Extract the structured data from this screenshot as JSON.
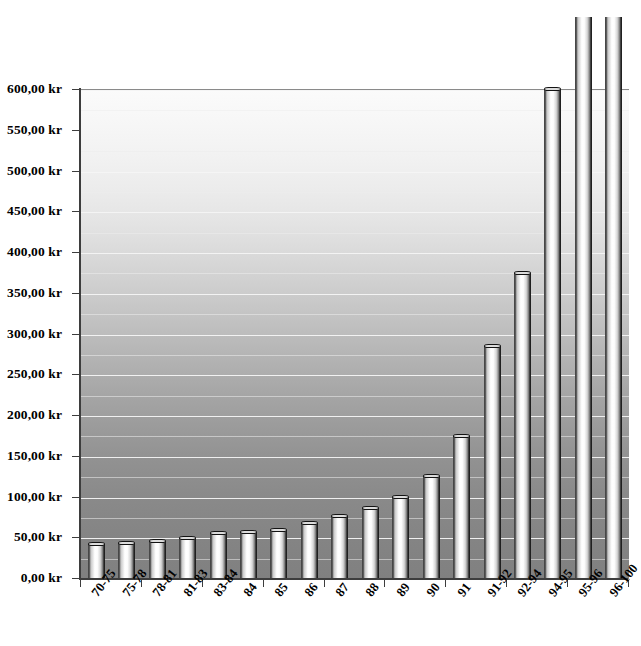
{
  "chart_data": {
    "type": "bar",
    "title": "",
    "subtitle": "",
    "xlabel": "",
    "ylabel": "",
    "currency_suffix": "kr",
    "decimal_separator": ",",
    "ylim": [
      0,
      600
    ],
    "y_tick_step": 50,
    "y_gridline_step": 25,
    "grid": true,
    "legend": false,
    "legend_position": "none",
    "note": "Last two bars exceed the plotted axis maximum and are clipped by the top of the image.",
    "categories": [
      "70-75",
      "75-78",
      "78-81",
      "81-83",
      "83-84",
      "84",
      "85",
      "86",
      "87",
      "88",
      "89",
      "90",
      "91",
      "91-92",
      "92-94",
      "94-95",
      "95-96",
      "96-100"
    ],
    "values": [
      43,
      44,
      47,
      50,
      56,
      58,
      60,
      69,
      77,
      87,
      101,
      127,
      175,
      286,
      375,
      601,
      690,
      690
    ],
    "clipped_flags": [
      false,
      false,
      false,
      false,
      false,
      false,
      false,
      false,
      false,
      false,
      false,
      false,
      false,
      false,
      false,
      false,
      true,
      true
    ],
    "y_tick_labels": [
      "0,00 kr",
      "50,00 kr",
      "100,00 kr",
      "150,00 kr",
      "200,00 kr",
      "250,00 kr",
      "300,00 kr",
      "350,00 kr",
      "400,00 kr",
      "450,00 kr",
      "500,00 kr",
      "550,00 kr",
      "600,00 kr"
    ],
    "y_tick_values": [
      0,
      50,
      100,
      150,
      200,
      250,
      300,
      350,
      400,
      450,
      500,
      550,
      600
    ],
    "colors": {
      "bar_highlight": "#ffffff",
      "bar_shadow": "#101010",
      "plot_bg_top": "#fbfbfb",
      "plot_bg_bottom": "#808080",
      "gridline": "#f4f4f4",
      "axis": "#3d3d3d",
      "text": "#000000"
    }
  }
}
